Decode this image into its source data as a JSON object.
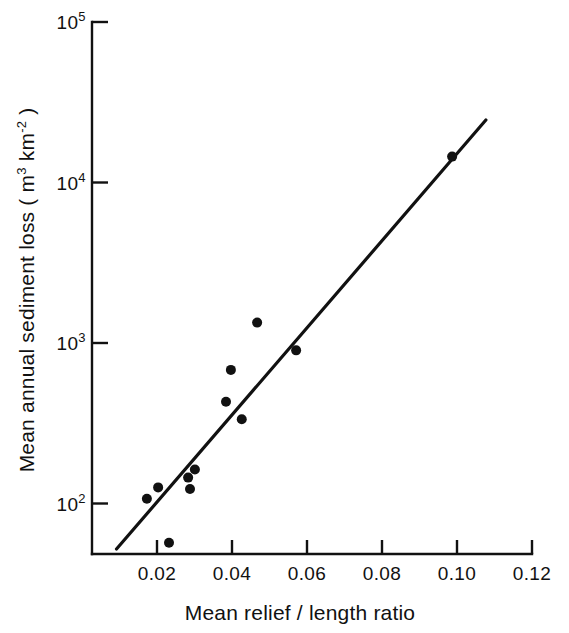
{
  "chart_data": {
    "type": "scatter",
    "title": "",
    "xlabel": "Mean relief / length ratio",
    "ylabel": "Mean annual sediment loss ( m3  km-2 )",
    "ylabel_parts": {
      "lead": "Mean annual sediment loss ( m",
      "sup1": "3",
      "mid": "  km",
      "sup2": "-2",
      "tail": " )"
    },
    "xscale": "linear",
    "yscale": "log",
    "xlim": [
      0.0,
      0.125
    ],
    "ylim": [
      40,
      100000
    ],
    "grid": false,
    "legend": null,
    "x_ticks": [
      0.02,
      0.04,
      0.06,
      0.08,
      0.1,
      0.12
    ],
    "x_tick_labels": [
      "0.02",
      "0.04",
      "0.06",
      "0.08",
      "0.10",
      "0.12"
    ],
    "y_ticks": [
      100,
      1000,
      10000,
      100000
    ],
    "y_tick_labels": [
      "10^2",
      "10^3",
      "10^4",
      "10^5"
    ],
    "y_tick_label_parts": [
      {
        "base": "10",
        "exp": "2"
      },
      {
        "base": "10",
        "exp": "3"
      },
      {
        "base": "10",
        "exp": "4"
      },
      {
        "base": "10",
        "exp": "5"
      }
    ],
    "points": [
      {
        "x": 0.0173,
        "y": 107
      },
      {
        "x": 0.0203,
        "y": 126
      },
      {
        "x": 0.0232,
        "y": 57
      },
      {
        "x": 0.0283,
        "y": 145
      },
      {
        "x": 0.0288,
        "y": 123
      },
      {
        "x": 0.0301,
        "y": 163
      },
      {
        "x": 0.0384,
        "y": 430
      },
      {
        "x": 0.0397,
        "y": 680
      },
      {
        "x": 0.0426,
        "y": 335
      },
      {
        "x": 0.0467,
        "y": 1340
      },
      {
        "x": 0.0571,
        "y": 900
      },
      {
        "x": 0.0987,
        "y": 14500
      }
    ],
    "trend_line": {
      "label": "regression line",
      "x_start": 0.0092,
      "y_start": 52,
      "x_end": 0.1077,
      "y_end": 24500
    },
    "marker_radius_px": 5,
    "colors": {
      "ink": "#111111",
      "background": "#ffffff",
      "point": "#111111",
      "line": "#111111"
    }
  }
}
